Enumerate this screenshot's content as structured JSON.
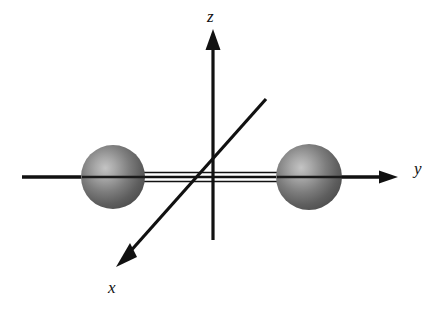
{
  "figure": {
    "kind": "3d-cartesian-axes-with-two-spheres",
    "width": 445,
    "height": 309,
    "background_color": "#ffffff",
    "stroke_color": "#111111"
  },
  "axes": {
    "z": {
      "label": "z",
      "orientation": "vertical",
      "has_arrowhead": true,
      "arrow_end": "top",
      "x": 213,
      "y_top": 30,
      "y_bottom": 240
    },
    "y": {
      "label": "y",
      "orientation": "horizontal",
      "has_arrowhead": true,
      "arrow_end": "right",
      "y": 177,
      "x_left": 22,
      "x_right": 398,
      "line_count_between_spheres": 3
    },
    "x": {
      "label": "x",
      "orientation": "diagonal",
      "has_arrowhead": true,
      "arrow_end": "lower-left",
      "x_start": 266,
      "y_start": 99,
      "x_end": 117,
      "y_end": 266
    }
  },
  "spheres": [
    {
      "name": "left-sphere",
      "cx": 113,
      "cy": 177,
      "r": 32,
      "highlight_color": "#b9b9b9",
      "mid_color": "#6e6e6e",
      "edge_color": "#4a4a4a",
      "on_axis": "y-negative"
    },
    {
      "name": "right-sphere",
      "cx": 309,
      "cy": 177,
      "r": 33,
      "highlight_color": "#b9b9b9",
      "mid_color": "#6e6e6e",
      "edge_color": "#4a4a4a",
      "on_axis": "y-positive"
    }
  ],
  "labels": {
    "z": "z",
    "y": "y",
    "x": "x"
  }
}
